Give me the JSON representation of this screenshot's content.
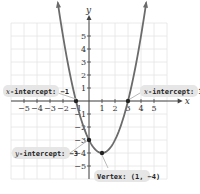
{
  "chart_data": {
    "type": "line",
    "title": "",
    "function": "y = (x-1)^2 - 4",
    "xlabel": "x",
    "ylabel": "y",
    "xlim": [
      -6,
      6
    ],
    "ylim": [
      -6,
      6
    ],
    "grid": true,
    "x_ticks": [
      -5,
      -4,
      -3,
      -2,
      -1,
      1,
      2,
      3,
      4,
      5
    ],
    "y_ticks": [
      5,
      4,
      3,
      2,
      1,
      -1,
      -2,
      -3,
      -4,
      -5
    ],
    "x_tick_labels": [
      "−5",
      "−4",
      "−3",
      "−2",
      "−1",
      "1",
      "2",
      "3",
      "4",
      "5"
    ],
    "y_tick_labels": [
      "5",
      "4",
      "3",
      "2",
      "1",
      "−1",
      "−2",
      "−3",
      "−4",
      "−5"
    ],
    "series": [
      {
        "name": "parabola",
        "x": [
          -2.4,
          -2,
          -1,
          0,
          1,
          2,
          3,
          4,
          4.4
        ],
        "y": [
          7.56,
          5,
          0,
          -3,
          -4,
          -3,
          0,
          5,
          7.56
        ]
      }
    ],
    "points": [
      {
        "x": -1,
        "y": 0,
        "label": "x-intercept: −1"
      },
      {
        "x": 3,
        "y": 0,
        "label": "x-intercept: 3"
      },
      {
        "x": 0,
        "y": -3,
        "label": "y-intercept: −3"
      },
      {
        "x": 1,
        "y": -4,
        "label": "Vertex: (1, −4)"
      }
    ],
    "annotations": [
      {
        "text_prefix": "x",
        "text": "-intercept: −1"
      },
      {
        "text_prefix": "x",
        "text": "-intercept: 3"
      },
      {
        "text_prefix": "y",
        "text": "-intercept: −3"
      },
      {
        "text_prefix": "",
        "text": "Vertex: (1, −4)"
      }
    ]
  },
  "labels": {
    "x_axis": "x",
    "y_axis": "y",
    "callout_xint_left_var": "x",
    "callout_xint_left": "-intercept: −1",
    "callout_xint_right_var": "x",
    "callout_xint_right": "-intercept: 3",
    "callout_yint_var": "y",
    "callout_yint": "-intercept: −3",
    "callout_vertex": "Vertex: (1, −4)"
  }
}
